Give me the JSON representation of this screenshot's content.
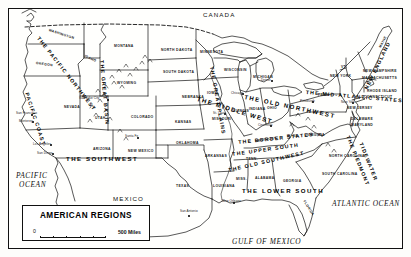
{
  "map": {
    "title": "AMERICAN REGIONS",
    "scale": {
      "zero": "0",
      "max": "500 Miles"
    },
    "countries": [
      {
        "name": "CANADA",
        "x": 203,
        "y": 12
      },
      {
        "name": "MEXICO",
        "x": 113,
        "y": 196
      }
    ],
    "oceans": [
      {
        "name": "PACIFIC",
        "x": 16,
        "y": 172
      },
      {
        "name": "OCEAN",
        "x": 19,
        "y": 181
      },
      {
        "name": "ATLANTIC OCEAN",
        "x": 332,
        "y": 200
      },
      {
        "name": "GULF OF MEXICO",
        "x": 232,
        "y": 238
      }
    ],
    "regions": [
      {
        "name": "THE PACIFIC NORTHWEST",
        "x": 40,
        "y": 36,
        "rotate": 52,
        "size": "sm"
      },
      {
        "name": "PACIFIC COAST",
        "x": 29,
        "y": 92,
        "rotate": 72,
        "size": "sm"
      },
      {
        "name": "THE GREAT BASIN",
        "x": 104,
        "y": 60,
        "rotate": 85,
        "size": "sm"
      },
      {
        "name": "THE GREAT PLAINS",
        "x": 214,
        "y": 66,
        "rotate": 80,
        "size": "sm"
      },
      {
        "name": "THE SOUTHWEST",
        "x": 66,
        "y": 156,
        "rotate": 0,
        "size": "lg"
      },
      {
        "name": "THE MIDDLE WEST",
        "x": 198,
        "y": 96,
        "rotate": 17,
        "size": "lg"
      },
      {
        "name": "THE OLD NORTHWEST",
        "x": 245,
        "y": 94,
        "rotate": 12,
        "size": "lg"
      },
      {
        "name": "THE MID-ATLANTIC STATES",
        "x": 306,
        "y": 90,
        "rotate": 5,
        "size": "sm"
      },
      {
        "name": "NEW ENGLAND",
        "x": 364,
        "y": 88,
        "rotate": -64,
        "size": "sm"
      },
      {
        "name": "THE BORDER STATES",
        "x": 238,
        "y": 140,
        "rotate": -6,
        "size": "sm"
      },
      {
        "name": "THE UPPER SOUTH",
        "x": 232,
        "y": 152,
        "rotate": -8,
        "size": "sm"
      },
      {
        "name": "THE OLD SOUTHWEST",
        "x": 228,
        "y": 168,
        "rotate": -13,
        "size": "sm"
      },
      {
        "name": "THE LOWER SOUTH",
        "x": 242,
        "y": 188,
        "rotate": 0,
        "size": "lg"
      },
      {
        "name": "THE PIEDMONT",
        "x": 350,
        "y": 135,
        "rotate": 68,
        "size": "sm"
      },
      {
        "name": "TIDEWATER",
        "x": 363,
        "y": 142,
        "rotate": 68,
        "size": "sm"
      }
    ],
    "states": [
      {
        "name": "WASHINGTON",
        "x": 49,
        "y": 29,
        "rotate": 18
      },
      {
        "name": "OREGON",
        "x": 36,
        "y": 62,
        "rotate": 8
      },
      {
        "name": "IDAHO",
        "x": 85,
        "y": 55,
        "rotate": 24
      },
      {
        "name": "MONTANA",
        "x": 114,
        "y": 45,
        "rotate": 0
      },
      {
        "name": "NORTH DAKOTA",
        "x": 161,
        "y": 49,
        "rotate": 0
      },
      {
        "name": "SOUTH DAKOTA",
        "x": 163,
        "y": 71,
        "rotate": 0
      },
      {
        "name": "MINNESOTA",
        "x": 200,
        "y": 51,
        "rotate": 0
      },
      {
        "name": "WISCONSIN",
        "x": 224,
        "y": 69,
        "rotate": 0
      },
      {
        "name": "WYOMING",
        "x": 117,
        "y": 82,
        "rotate": 0
      },
      {
        "name": "NEVADA",
        "x": 64,
        "y": 106,
        "rotate": 0
      },
      {
        "name": "UTAH",
        "x": 95,
        "y": 117,
        "rotate": 0
      },
      {
        "name": "COLORADO",
        "x": 131,
        "y": 116,
        "rotate": 0
      },
      {
        "name": "NEBRASKA",
        "x": 182,
        "y": 96,
        "rotate": 0
      },
      {
        "name": "KANSAS",
        "x": 175,
        "y": 121,
        "rotate": 0
      },
      {
        "name": "IOWA",
        "x": 207,
        "y": 92,
        "rotate": 0
      },
      {
        "name": "MISSOURI",
        "x": 212,
        "y": 118,
        "rotate": 0
      },
      {
        "name": "ILLINOIS",
        "x": 232,
        "y": 110,
        "rotate": 0
      },
      {
        "name": "INDIANA",
        "x": 249,
        "y": 108,
        "rotate": 0
      },
      {
        "name": "OHIO",
        "x": 267,
        "y": 107,
        "rotate": 0
      },
      {
        "name": "MICHIGAN",
        "x": 253,
        "y": 76,
        "rotate": 0
      },
      {
        "name": "OKLAHOMA",
        "x": 176,
        "y": 142,
        "rotate": 0
      },
      {
        "name": "ARIZONA",
        "x": 93,
        "y": 148,
        "rotate": 0
      },
      {
        "name": "NEW MEXICO",
        "x": 128,
        "y": 150,
        "rotate": 0
      },
      {
        "name": "TEXAS",
        "x": 176,
        "y": 185,
        "rotate": 0
      },
      {
        "name": "ARKANSAS",
        "x": 205,
        "y": 155,
        "rotate": 0
      },
      {
        "name": "LOUISIANA",
        "x": 213,
        "y": 185,
        "rotate": 0
      },
      {
        "name": "MISS.",
        "x": 236,
        "y": 178,
        "rotate": 0
      },
      {
        "name": "ALABAMA",
        "x": 255,
        "y": 177,
        "rotate": 0
      },
      {
        "name": "GEORGIA",
        "x": 283,
        "y": 180,
        "rotate": 0
      },
      {
        "name": "FLORIDA",
        "x": 305,
        "y": 200,
        "rotate": 58
      },
      {
        "name": "TENN.",
        "x": 246,
        "y": 158,
        "rotate": 0
      },
      {
        "name": "KENTUCKY",
        "x": 255,
        "y": 140,
        "rotate": -8
      },
      {
        "name": "W. VA.",
        "x": 287,
        "y": 135,
        "rotate": 0
      },
      {
        "name": "VIRGINIA",
        "x": 307,
        "y": 134,
        "rotate": 0
      },
      {
        "name": "NORTH CAROLINA",
        "x": 329,
        "y": 155,
        "rotate": 0
      },
      {
        "name": "SOUTH CAROLINA",
        "x": 322,
        "y": 173,
        "rotate": 0
      },
      {
        "name": "PENN.",
        "x": 318,
        "y": 94,
        "rotate": 0
      },
      {
        "name": "NEW YORK",
        "x": 330,
        "y": 75,
        "rotate": 0
      },
      {
        "name": "NEW JERSEY",
        "x": 347,
        "y": 107,
        "rotate": 0
      },
      {
        "name": "DELAWARE",
        "x": 351,
        "y": 118,
        "rotate": 0
      },
      {
        "name": "MARYLAND",
        "x": 351,
        "y": 124,
        "rotate": 0
      },
      {
        "name": "VT.",
        "x": 341,
        "y": 66,
        "rotate": 0
      },
      {
        "name": "NEW HAMPSHIRE",
        "x": 363,
        "y": 70,
        "rotate": 0
      },
      {
        "name": "MASSACHUSETTS",
        "x": 362,
        "y": 77,
        "rotate": 0
      },
      {
        "name": "RHODE ISLAND",
        "x": 367,
        "y": 90,
        "rotate": 0
      },
      {
        "name": "CONNECTICUT",
        "x": 364,
        "y": 96,
        "rotate": 0
      },
      {
        "name": "MAINE",
        "x": 379,
        "y": 47,
        "rotate": -62
      }
    ],
    "cities": [
      {
        "name": "Salt Lake City",
        "x": 79,
        "y": 97,
        "dx": 28,
        "dy": 2
      },
      {
        "name": "San Francisco",
        "x": 16,
        "y": 112,
        "dx": 15,
        "dy": 2
      },
      {
        "name": "Monterey",
        "x": 19,
        "y": 120,
        "dx": 13,
        "dy": 1
      },
      {
        "name": "Los Angeles",
        "x": 33,
        "y": 143,
        "dx": 17,
        "dy": 1
      },
      {
        "name": "San Diego",
        "x": 37,
        "y": 152,
        "dx": 15,
        "dy": 1
      },
      {
        "name": "Santa Fe",
        "x": 125,
        "y": 135,
        "dx": 12,
        "dy": 2
      },
      {
        "name": "San Antonio",
        "x": 180,
        "y": 210,
        "dx": 8,
        "dy": 5
      },
      {
        "name": "New Orleans",
        "x": 222,
        "y": 200,
        "dx": 11,
        "dy": 2
      },
      {
        "name": "St. Louis",
        "x": 213,
        "y": 112,
        "dx": 11,
        "dy": 1
      },
      {
        "name": "Chicago",
        "x": 231,
        "y": 92,
        "dx": 11,
        "dy": 1
      },
      {
        "name": "Detroit",
        "x": 261,
        "y": 79,
        "dx": 10,
        "dy": 1
      },
      {
        "name": "Cincinnati",
        "x": 258,
        "y": 124,
        "dx": 12,
        "dy": 1
      },
      {
        "name": "Pittsburgh",
        "x": 300,
        "y": 100,
        "dx": 12,
        "dy": 1
      },
      {
        "name": "New York",
        "x": 341,
        "y": 101,
        "dx": 11,
        "dy": 1
      }
    ]
  }
}
